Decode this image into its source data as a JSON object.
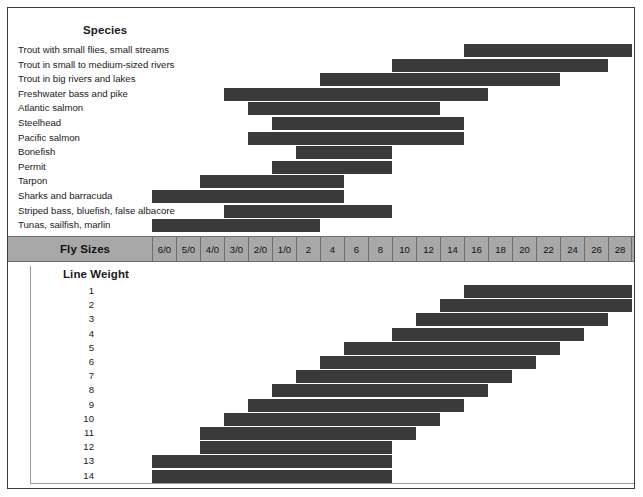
{
  "chart_data": {
    "type": "bar",
    "grid": false,
    "legend": "none",
    "axis": {
      "columns_label": "Fly Sizes",
      "columns": [
        "6/0",
        "5/0",
        "4/0",
        "3/0",
        "2/0",
        "1/0",
        "2",
        "4",
        "6",
        "8",
        "10",
        "12",
        "14",
        "16",
        "18",
        "20",
        "22",
        "24",
        "26",
        "28"
      ],
      "column_count": 20,
      "note": "Columns run coarse (6/0) on the left to fine (28) on the right"
    },
    "panels": [
      {
        "name": "species",
        "row_label": "Species",
        "unit": "fly size column index (0 = 6/0 .. 19 = 28)",
        "rows": [
          {
            "label": "Trout with small flies, small streams",
            "start_index": 13,
            "end_index": 20,
            "start_size": "16",
            "end_size": "28"
          },
          {
            "label": "Trout in small to medium-sized rivers",
            "start_index": 10,
            "end_index": 19,
            "start_size": "10",
            "end_size": "26"
          },
          {
            "label": "Trout in big rivers and lakes",
            "start_index": 7,
            "end_index": 17,
            "start_size": "4",
            "end_size": "22"
          },
          {
            "label": "Freshwater bass and pike",
            "start_index": 3,
            "end_index": 14,
            "start_size": "3/0",
            "end_size": "16"
          },
          {
            "label": "Atlantic salmon",
            "start_index": 4,
            "end_index": 12,
            "start_size": "2/0",
            "end_size": "12"
          },
          {
            "label": "Steelhead",
            "start_index": 5,
            "end_index": 13,
            "start_size": "1/0",
            "end_size": "14"
          },
          {
            "label": "Pacific salmon",
            "start_index": 4,
            "end_index": 13,
            "start_size": "2/0",
            "end_size": "14"
          },
          {
            "label": "Bonefish",
            "start_index": 6,
            "end_index": 10,
            "start_size": "2",
            "end_size": "10"
          },
          {
            "label": "Permit",
            "start_index": 5,
            "end_index": 10,
            "start_size": "1/0",
            "end_size": "10"
          },
          {
            "label": "Tarpon",
            "start_index": 2,
            "end_index": 8,
            "start_size": "4/0",
            "end_size": "6"
          },
          {
            "label": "Sharks and barracuda",
            "start_index": 0,
            "end_index": 8,
            "start_size": "6/0",
            "end_size": "6"
          },
          {
            "label": "Striped bass, bluefish, false albacore",
            "start_index": 3,
            "end_index": 10,
            "start_size": "3/0",
            "end_size": "10"
          },
          {
            "label": "Tunas, sailfish, marlin",
            "start_index": 0,
            "end_index": 7,
            "start_size": "6/0",
            "end_size": "4"
          }
        ]
      },
      {
        "name": "line-weight",
        "row_label": "Line Weight",
        "unit": "fly size column index (0 = 6/0 .. 19 = 28)",
        "rows": [
          {
            "label": "1",
            "start_index": 13,
            "end_index": 20,
            "start_size": "16",
            "end_size": "28"
          },
          {
            "label": "2",
            "start_index": 12,
            "end_index": 20,
            "start_size": "14",
            "end_size": "28"
          },
          {
            "label": "3",
            "start_index": 11,
            "end_index": 19,
            "start_size": "12",
            "end_size": "26"
          },
          {
            "label": "4",
            "start_index": 10,
            "end_index": 18,
            "start_size": "10",
            "end_size": "24"
          },
          {
            "label": "5",
            "start_index": 8,
            "end_index": 17,
            "start_size": "6",
            "end_size": "22"
          },
          {
            "label": "6",
            "start_index": 7,
            "end_index": 16,
            "start_size": "4",
            "end_size": "20"
          },
          {
            "label": "7",
            "start_index": 6,
            "end_index": 15,
            "start_size": "2",
            "end_size": "18"
          },
          {
            "label": "8",
            "start_index": 5,
            "end_index": 14,
            "start_size": "1/0",
            "end_size": "16"
          },
          {
            "label": "9",
            "start_index": 4,
            "end_index": 13,
            "start_size": "2/0",
            "end_size": "14"
          },
          {
            "label": "10",
            "start_index": 3,
            "end_index": 12,
            "start_size": "3/0",
            "end_size": "12"
          },
          {
            "label": "11",
            "start_index": 2,
            "end_index": 11,
            "start_size": "4/0",
            "end_size": "12"
          },
          {
            "label": "12",
            "start_index": 2,
            "end_index": 10,
            "start_size": "4/0",
            "end_size": "10"
          },
          {
            "label": "13",
            "start_index": 0,
            "end_index": 10,
            "start_size": "6/0",
            "end_size": "10"
          },
          {
            "label": "14",
            "start_index": 0,
            "end_index": 10,
            "start_size": "6/0",
            "end_size": "10"
          }
        ]
      }
    ],
    "colors": {
      "bar": "#3a3a3a",
      "band_background": "#a8a8a8",
      "band_border": "#6d6d6d",
      "frame": "#3b3b3b",
      "text": "#1a1a1a",
      "page_background": "#ffffff"
    }
  }
}
